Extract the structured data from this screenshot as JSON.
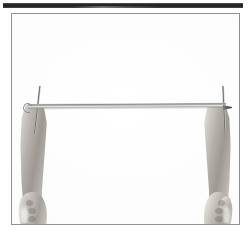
{
  "page": {
    "kind": "photographic-figure",
    "background_color": "#ffffff",
    "width": 251,
    "height": 238
  },
  "top_rule": {
    "label": "horizontal rule",
    "color": "#1e1e1e"
  },
  "photo": {
    "label": "photograph",
    "border_color": "#8f9092",
    "background_color": "#fefefe",
    "caption": "",
    "subject": "Two hands holding a thin horizontal metal rod",
    "elements": {
      "rod": {
        "name": "horizontal metal rod",
        "color": "#b9b9b6"
      },
      "hook": {
        "name": "hook eyelet at left rod end",
        "color": "#8b8b89"
      },
      "tip": {
        "name": "pointed tip at right rod end",
        "color": "#3e3e3c"
      },
      "needle_left": {
        "name": "vertical needle at left",
        "color": "#6f6f6d"
      },
      "needle_right": {
        "name": "vertical needle at right",
        "color": "#6f6f6d"
      },
      "hand_left": {
        "name": "left hand gripping rod",
        "skin_color": "#bdb9b3"
      },
      "hand_right": {
        "name": "right hand gripping rod",
        "skin_color": "#bdb9b3"
      }
    }
  }
}
